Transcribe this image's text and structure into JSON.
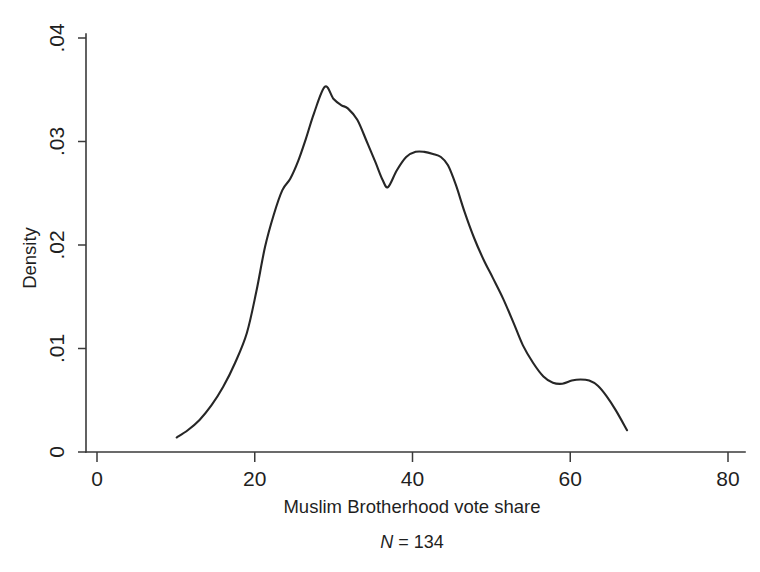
{
  "figure": {
    "background_color": "#ffffff",
    "line_color": "#262626",
    "axis_color": "#3a3a3a"
  },
  "chart_data": {
    "type": "line",
    "title": "",
    "subtitle": "",
    "xlabel": "Muslim Brotherhood vote share",
    "ylabel": "Density",
    "xlim": [
      0,
      80
    ],
    "ylim": [
      0,
      0.04
    ],
    "grid": false,
    "legend": null,
    "xticks": [
      0,
      20,
      40,
      60,
      80
    ],
    "xtick_labels": [
      "0",
      "20",
      "40",
      "60",
      "80"
    ],
    "yticks": [
      0,
      0.01,
      0.02,
      0.03,
      0.04
    ],
    "ytick_labels": [
      "0",
      ".01",
      ".02",
      ".03",
      ".04"
    ],
    "annotation": "N = 134",
    "annotation_parts": {
      "symbol": "N",
      "equals": " = ",
      "value": "134"
    },
    "sample_size": 134,
    "series": [
      {
        "name": "Kernel density of Muslim Brotherhood vote share",
        "x": [
          10.1,
          11.5,
          13.0,
          14.5,
          16.0,
          17.5,
          19.0,
          20.2,
          21.3,
          22.4,
          23.5,
          24.5,
          25.5,
          26.5,
          27.5,
          28.9,
          30.0,
          31.0,
          31.8,
          33.0,
          34.2,
          35.3,
          36.2,
          36.9,
          38.0,
          39.2,
          40.4,
          41.5,
          42.6,
          43.6,
          44.5,
          45.5,
          46.6,
          47.8,
          49.0,
          50.2,
          51.5,
          52.8,
          54.0,
          55.3,
          56.6,
          57.8,
          59.0,
          60.2,
          61.3,
          62.4,
          63.5,
          64.6,
          65.8,
          67.2
        ],
        "y": [
          0.0014,
          0.0021,
          0.0031,
          0.0045,
          0.0063,
          0.0086,
          0.0115,
          0.0155,
          0.0198,
          0.0229,
          0.0253,
          0.0264,
          0.0281,
          0.0303,
          0.0327,
          0.0353,
          0.0341,
          0.0335,
          0.0332,
          0.0321,
          0.03,
          0.028,
          0.0263,
          0.0256,
          0.0272,
          0.0285,
          0.029,
          0.029,
          0.0288,
          0.0285,
          0.0277,
          0.0258,
          0.0232,
          0.0207,
          0.0186,
          0.0168,
          0.0148,
          0.0125,
          0.0103,
          0.0086,
          0.0073,
          0.0067,
          0.0066,
          0.0069,
          0.007,
          0.0069,
          0.0064,
          0.0054,
          0.004,
          0.0021
        ]
      }
    ],
    "features": {
      "mode_1_x": 29,
      "mode_1_y": 0.0353,
      "mode_2_x": 42,
      "mode_2_y": 0.029,
      "trough_x": 37,
      "trough_y": 0.0256,
      "shoulder_x": 61,
      "shoulder_y": 0.007,
      "data_start_x": 10.1,
      "data_end_x": 67.2
    }
  },
  "caption": {
    "cut_off_text": ""
  }
}
